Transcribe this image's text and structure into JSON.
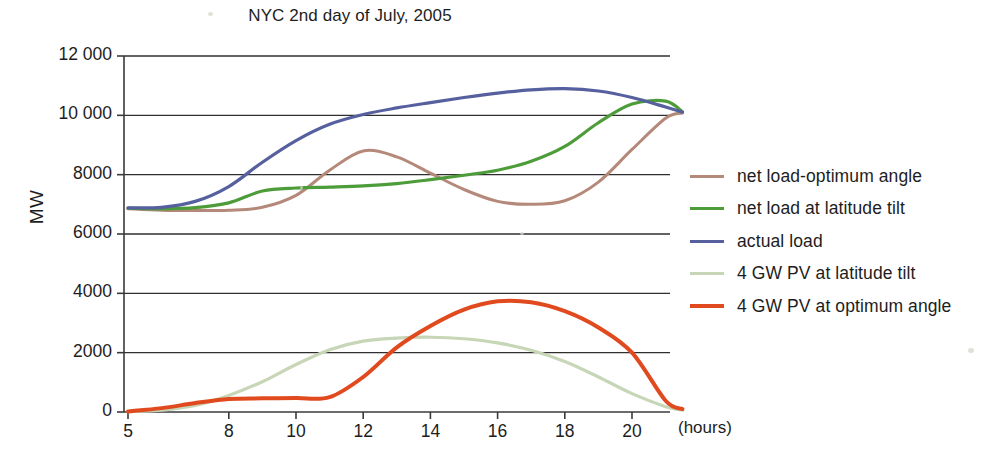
{
  "chart_data": {
    "type": "line",
    "title": "NYC 2nd day of July, 2005",
    "xlabel": "(hours)",
    "ylabel": "MW",
    "xlim": [
      5,
      21.5
    ],
    "ylim": [
      0,
      12000
    ],
    "grid": true,
    "legend_position": "right",
    "x_ticks": [
      "5",
      "8",
      "10",
      "12",
      "14",
      "16",
      "18",
      "20"
    ],
    "x_tick_values": [
      5,
      8,
      10,
      12,
      14,
      16,
      18,
      20
    ],
    "y_ticks": [
      "0",
      "2000",
      "4000",
      "6000",
      "8000",
      "10 000",
      "12 000"
    ],
    "y_tick_values": [
      0,
      2000,
      4000,
      6000,
      8000,
      10000,
      12000
    ],
    "x": [
      5,
      6,
      7,
      8,
      9,
      10,
      11,
      12,
      13,
      14,
      15,
      16,
      17,
      18,
      19,
      20,
      21,
      21.5
    ],
    "series": [
      {
        "name": "net load-optimum angle",
        "color": "#b5897a",
        "width": 3.0,
        "values": [
          6850,
          6800,
          6790,
          6800,
          6900,
          7300,
          8150,
          8800,
          8600,
          8050,
          7500,
          7100,
          7000,
          7120,
          7750,
          8850,
          9900,
          10080
        ]
      },
      {
        "name": "net load at latitude tilt",
        "color": "#4d9c3a",
        "width": 3.2,
        "values": [
          6870,
          6850,
          6890,
          7050,
          7450,
          7550,
          7580,
          7620,
          7700,
          7830,
          7980,
          8150,
          8450,
          8950,
          9750,
          10380,
          10480,
          10120
        ]
      },
      {
        "name": "actual load",
        "color": "#56609f",
        "width": 3.2,
        "values": [
          6880,
          6900,
          7100,
          7600,
          8420,
          9150,
          9700,
          10030,
          10250,
          10430,
          10600,
          10750,
          10860,
          10900,
          10820,
          10600,
          10280,
          10110
        ]
      },
      {
        "name": "4 GW PV at latitude tilt",
        "color": "#c6d6b6",
        "width": 3.2,
        "values": [
          10,
          60,
          220,
          560,
          1020,
          1600,
          2100,
          2390,
          2490,
          2520,
          2470,
          2330,
          2080,
          1700,
          1180,
          620,
          180,
          60
        ]
      },
      {
        "name": "4 GW PV at optimum angle",
        "color": "#e04a1e",
        "width": 4.0,
        "values": [
          20,
          130,
          300,
          440,
          460,
          470,
          500,
          1180,
          2180,
          2900,
          3450,
          3730,
          3700,
          3400,
          2850,
          2000,
          380,
          100
        ]
      }
    ],
    "annotations": []
  },
  "legend": {
    "items": [
      {
        "label": "net load-optimum angle",
        "color": "#b5897a"
      },
      {
        "label": "net load at latitude tilt",
        "color": "#4d9c3a"
      },
      {
        "label": "actual load",
        "color": "#56609f"
      },
      {
        "label": "4 GW PV at latitude tilt",
        "color": "#c6d6b6"
      },
      {
        "label": "4 GW PV at optimum angle",
        "color": "#e04a1e"
      }
    ]
  }
}
